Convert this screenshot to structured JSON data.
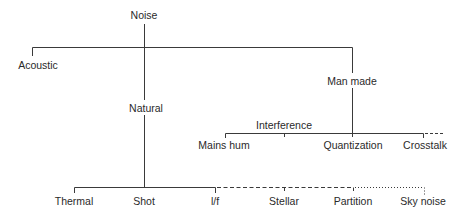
{
  "diagram": {
    "type": "tree",
    "line_color": "#3a3a3a",
    "text_color": "#2a2a2a",
    "nodes": {
      "root": {
        "label": "Noise",
        "x": 144,
        "y": 11
      },
      "acoustic": {
        "label": "Acoustic",
        "x": 37,
        "y": 60
      },
      "natural": {
        "label": "Natural",
        "x": 146,
        "y": 103
      },
      "man_made": {
        "label": "Man made",
        "x": 352,
        "y": 76
      },
      "interference": {
        "label": "Interference",
        "x": 284,
        "y": 120
      },
      "mains_hum": {
        "label": "Mains hum",
        "x": 225,
        "y": 140
      },
      "quantization": {
        "label": "Quantization",
        "x": 353,
        "y": 140
      },
      "crosstalk": {
        "label": "Crosstalk",
        "x": 423,
        "y": 140
      },
      "thermal": {
        "label": "Thermal",
        "x": 74,
        "y": 195
      },
      "shot": {
        "label": "Shot",
        "x": 144,
        "y": 195
      },
      "one_over_f": {
        "label": "l/f",
        "x": 215,
        "y": 195
      },
      "stellar": {
        "label": "Stellar",
        "x": 284,
        "y": 195
      },
      "partition": {
        "label": "Partition",
        "x": 353,
        "y": 195
      },
      "sky_noise": {
        "label": "Sky noise",
        "x": 423,
        "y": 195
      }
    },
    "edges": [
      {
        "from": "root",
        "to": "acoustic",
        "style": "solid"
      },
      {
        "from": "root",
        "to": "man_made",
        "style": "solid"
      },
      {
        "from": "root",
        "to": "natural",
        "style": "solid"
      },
      {
        "from": "man_made",
        "to": "mains_hum",
        "style": "solid"
      },
      {
        "from": "man_made",
        "to": "interference",
        "style": "solid"
      },
      {
        "from": "man_made",
        "to": "quantization",
        "style": "solid"
      },
      {
        "from": "man_made",
        "to": "crosstalk",
        "style": "solid"
      },
      {
        "from": "natural",
        "to": "thermal",
        "style": "solid"
      },
      {
        "from": "natural",
        "to": "shot",
        "style": "solid"
      },
      {
        "from": "natural",
        "to": "one_over_f",
        "style": "solid"
      },
      {
        "from": "natural",
        "to": "stellar",
        "style": "dashed"
      },
      {
        "from": "natural",
        "to": "partition",
        "style": "dashed"
      },
      {
        "from": "natural",
        "to": "sky_noise",
        "style": "dotted"
      }
    ]
  }
}
